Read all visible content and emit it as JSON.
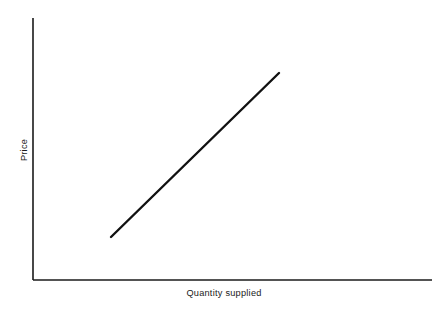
{
  "figure": {
    "background_color": "#ffffff",
    "line_color": "#111111",
    "axis_color": "#1a1a1a",
    "width": 448,
    "height": 316
  },
  "axes": {
    "x_label": "Quantity supplied",
    "y_label": "Price",
    "x_axis_name": "x-axis",
    "y_axis_name": "y-axis",
    "origin_x": 33,
    "origin_y": 280,
    "x_axis_end_x": 432,
    "y_axis_top_y": 18,
    "ticks": [],
    "tick_labels": [],
    "grid": false
  },
  "curve": {
    "name": "supply-curve",
    "label": "",
    "x1": 111,
    "y1": 237,
    "x2": 279,
    "y2": 73,
    "stroke_width": 2.4
  },
  "chart_data": {
    "type": "line",
    "title": "",
    "subtitle": "",
    "xlabel": "Quantity supplied",
    "ylabel": "Price",
    "grid": false,
    "legend": null,
    "xlim": [
      0,
      1
    ],
    "ylim": [
      0,
      1
    ],
    "axis_tick_labels": {
      "x": [],
      "y": []
    },
    "series": [
      {
        "name": "Supply",
        "x": [
          0.195,
          0.616
        ],
        "y": [
          0.164,
          0.79
        ],
        "description": "Upward-sloping straight supply curve: price rises as quantity supplied rises"
      }
    ],
    "annotations": []
  }
}
